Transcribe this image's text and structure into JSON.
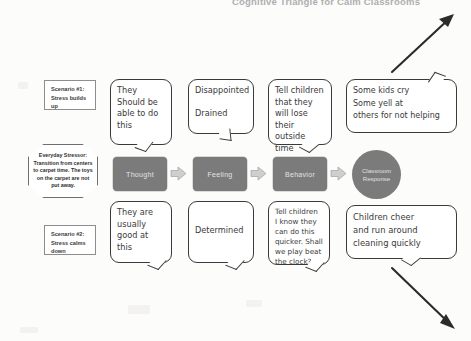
{
  "document": {
    "top_title_clipped": "Cognitive Triangle for Calm Classrooms"
  },
  "left_column": {
    "scenario_1": {
      "title": "Scenario #1:",
      "body": "Stress builds up"
    },
    "stressor": {
      "title": "Everyday Stressor:",
      "body": "Transition from centers to carpet time. The toys on the carpet are not put away."
    },
    "scenario_2": {
      "title": "Scenario #2:",
      "body": "Stress calms down"
    }
  },
  "process": {
    "steps": [
      {
        "label": "Thought",
        "shape": "rounded-rect"
      },
      {
        "label": "Feeling",
        "shape": "rounded-rect"
      },
      {
        "label": "Behavior",
        "shape": "rounded-rect"
      },
      {
        "label": "Classroom Response",
        "shape": "circle"
      }
    ],
    "connector_icon": "right-block-arrow-icon",
    "box_color": "#7b7b7b",
    "box_text_color": "#e3e3e3",
    "connector_color": "#c9c9c9"
  },
  "bubbles": {
    "upper": {
      "thought": "They\nShould be\nable to do\nthis",
      "feeling": "Disappointed\n\nDrained",
      "behavior": "Tell children\nthat they\nwill lose\ntheir outside\ntime",
      "response": "Some kids cry\nSome yell at\nothers for not helping"
    },
    "lower": {
      "thought": "They are\nusually\ngood at\n     this",
      "feeling": "Determined",
      "behavior": "Tell children\nI know they\ncan do this\nquicker. Shall\nwe play beat\nthe clock?",
      "response": "Children cheer\nand run around\ncleaning quickly"
    }
  },
  "arrows": {
    "top_right": {
      "icon": "diagonal-arrow-up-right-icon",
      "color": "#2b2b2b"
    },
    "bottom_right": {
      "icon": "diagonal-arrow-down-right-icon",
      "color": "#2b2b2b"
    }
  }
}
